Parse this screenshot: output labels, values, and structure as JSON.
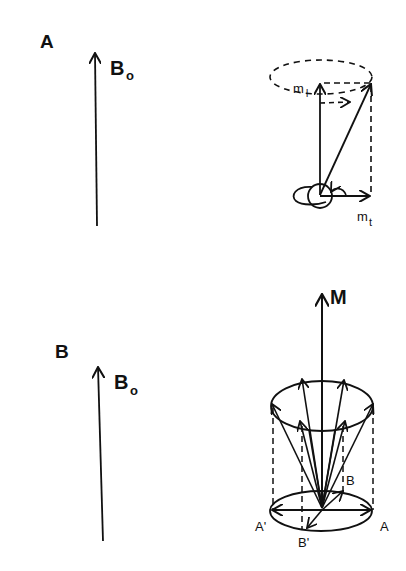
{
  "panels": {
    "a": {
      "label": "A",
      "field_label": "B",
      "field_sub": "o",
      "m_long_label": "m",
      "m_long_sub": "l",
      "m_trans_label": "m",
      "m_trans_sub": "t"
    },
    "b": {
      "label": "B",
      "field_label": "B",
      "field_sub": "o",
      "magnetization_label": "M",
      "point_A": "A",
      "point_A_prime": "A'",
      "point_B": "B",
      "point_B_prime": "B'"
    }
  },
  "colors": {
    "ink": "#111111",
    "background": "#ffffff"
  }
}
